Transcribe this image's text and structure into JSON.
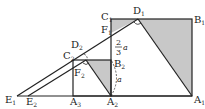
{
  "diagram": {
    "type": "geometry",
    "colors": {
      "line": "#222222",
      "shade": "#c8c8c8",
      "background": "#ffffff"
    },
    "points": {
      "A1": {
        "label": "A",
        "sub": "1"
      },
      "B1": {
        "label": "B",
        "sub": "1"
      },
      "C1": {
        "label": "C",
        "sub": "1"
      },
      "D1": {
        "label": "D",
        "sub": "1"
      },
      "E1": {
        "label": "E",
        "sub": "1"
      },
      "F1": {
        "label": "F",
        "sub": "1"
      },
      "A2": {
        "label": "A",
        "sub": "2"
      },
      "B2": {
        "label": "B",
        "sub": "2"
      },
      "C2": {
        "label": "C",
        "sub": "2"
      },
      "D2": {
        "label": "D",
        "sub": "2"
      },
      "E2": {
        "label": "E",
        "sub": "2"
      },
      "F2": {
        "label": "F",
        "sub": "2"
      },
      "A3": {
        "label": "A",
        "sub": "3"
      }
    },
    "annotations": {
      "frac_num": "2",
      "frac_den": "3",
      "frac_var": "a",
      "length_a": "a"
    }
  }
}
